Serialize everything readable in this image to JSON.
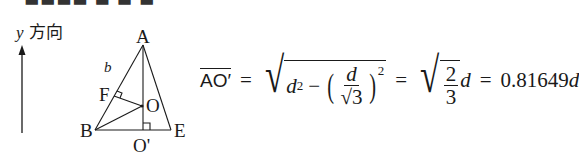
{
  "top_cut_text": "▬▬▬▬ ▬ ▬ ▬",
  "diagram": {
    "y_direction_label": {
      "var": "y",
      "text": "方向"
    },
    "vertices": {
      "A": "A",
      "B": "B",
      "E": "E",
      "F": "F",
      "O": "O",
      "O_prime": "O'"
    },
    "side_label": "b",
    "points": {
      "A": [
        143,
        45
      ],
      "B": [
        95,
        130
      ],
      "E": [
        171,
        130
      ],
      "O": [
        142,
        106
      ],
      "O_prime": [
        143,
        130
      ],
      "F": [
        114,
        96
      ]
    }
  },
  "formula": {
    "lhs": "AO′",
    "eq": "=",
    "d": "d",
    "sq": "2",
    "minus": "−",
    "num_d": "d",
    "sqrt3": "√3",
    "frac_num": "2",
    "frac_den": "3",
    "result": "0.81649",
    "full_text": "AO′ = √(d² − (d/√3)²) = √(2/3) d = 0.81649d"
  }
}
